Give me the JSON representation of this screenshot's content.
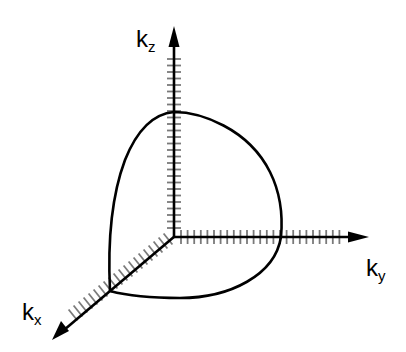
{
  "diagram": {
    "type": "3d-coordinate-axes-with-surface-curve",
    "colors": {
      "axis": "#000000",
      "ticks": "#7a7a7a",
      "curve": "#000000",
      "background": "#ffffff"
    },
    "origin": [
      174,
      236
    ],
    "axes": [
      {
        "id": "kz",
        "label_main": "k",
        "label_sub": "z",
        "direction": "up"
      },
      {
        "id": "ky",
        "label_main": "k",
        "label_sub": "y",
        "direction": "right"
      },
      {
        "id": "kx",
        "label_main": "k",
        "label_sub": "x",
        "direction": "down-left"
      }
    ],
    "curve": {
      "description": "closed curve bounding one octant of a spherical surface, meeting each axis",
      "z_intercept": [
        174,
        112
      ],
      "y_intercept": [
        281,
        237
      ],
      "x_intercept": [
        110,
        291
      ]
    }
  }
}
